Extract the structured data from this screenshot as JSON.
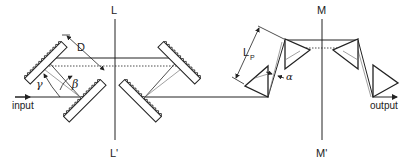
{
  "diagram": {
    "type": "optical-setup",
    "axes": {
      "grating_axis": {
        "top_label": "L",
        "bottom_label": "L'"
      },
      "prism_axis": {
        "top_label": "M",
        "bottom_label": "M'"
      }
    },
    "labels": {
      "input": "input",
      "output": "output",
      "distance": "D",
      "prism_distance": "L",
      "prism_distance_sub": "P",
      "angle_gamma": "γ",
      "angle_beta": "β",
      "angle_alpha": "α"
    },
    "components": {
      "gratings": 4,
      "prisms": 4
    },
    "colors": {
      "line": "#222222",
      "ray_light": "#777777"
    }
  }
}
